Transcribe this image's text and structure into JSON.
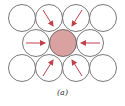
{
  "caption": "(a)",
  "colors": {
    "outline": "#555555",
    "center_fill": "#d9a19f",
    "arrow": "#c0404a"
  },
  "radius": 13.5,
  "circles": [
    {
      "x": 22,
      "y": 18
    },
    {
      "x": 49,
      "y": 18
    },
    {
      "x": 76,
      "y": 18
    },
    {
      "x": 103,
      "y": 18
    },
    {
      "x": 36,
      "y": 43
    },
    {
      "x": 90,
      "y": 43
    },
    {
      "x": 22,
      "y": 68
    },
    {
      "x": 49,
      "y": 68
    },
    {
      "x": 76,
      "y": 68
    },
    {
      "x": 103,
      "y": 68
    }
  ],
  "center": {
    "x": 63,
    "y": 43
  },
  "arrows": [
    {
      "x1": 43,
      "y1": 10,
      "x2": 53,
      "y2": 26
    },
    {
      "x1": 82,
      "y1": 10,
      "x2": 72,
      "y2": 26
    },
    {
      "x1": 26,
      "y1": 43,
      "x2": 45,
      "y2": 43
    },
    {
      "x1": 100,
      "y1": 43,
      "x2": 81,
      "y2": 43
    },
    {
      "x1": 43,
      "y1": 76,
      "x2": 53,
      "y2": 60
    },
    {
      "x1": 82,
      "y1": 76,
      "x2": 72,
      "y2": 60
    }
  ]
}
